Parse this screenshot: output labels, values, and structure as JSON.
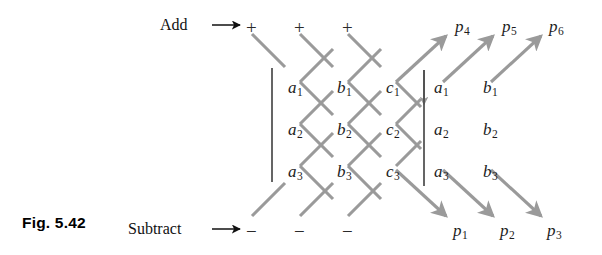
{
  "figure": {
    "caption": "Fig. 5.42",
    "add_label": "Add",
    "subtract_label": "Subtract",
    "add_arrow_icon": "right-arrow-icon",
    "subtract_arrow_icon": "right-arrow-icon",
    "line_color": "#9a9a9a",
    "text_color": "#1a1a1a",
    "background": "#ffffff"
  },
  "top_operators": [
    {
      "symbol": "+",
      "x": 246,
      "y": 18
    },
    {
      "symbol": "+",
      "x": 294,
      "y": 18
    },
    {
      "symbol": "+",
      "x": 342,
      "y": 18
    }
  ],
  "bottom_operators": [
    {
      "symbol": "−",
      "x": 246,
      "y": 222
    },
    {
      "symbol": "−",
      "x": 294,
      "y": 222
    },
    {
      "symbol": "−",
      "x": 342,
      "y": 222
    }
  ],
  "top_outputs": [
    {
      "base": "p",
      "sub": "4",
      "x": 455,
      "y": 18
    },
    {
      "base": "p",
      "sub": "5",
      "x": 502,
      "y": 18
    },
    {
      "base": "p",
      "sub": "6",
      "x": 549,
      "y": 18
    }
  ],
  "bottom_outputs": [
    {
      "base": "p",
      "sub": "1",
      "x": 453,
      "y": 222
    },
    {
      "base": "p",
      "sub": "2",
      "x": 500,
      "y": 222
    },
    {
      "base": "p",
      "sub": "3",
      "x": 547,
      "y": 222
    }
  ],
  "left_grid": [
    {
      "base": "a",
      "sub": "1",
      "x": 288,
      "y": 79
    },
    {
      "base": "b",
      "sub": "1",
      "x": 337,
      "y": 79
    },
    {
      "base": "c",
      "sub": "1",
      "x": 386,
      "y": 79
    },
    {
      "base": "a",
      "sub": "2",
      "x": 288,
      "y": 121
    },
    {
      "base": "b",
      "sub": "2",
      "x": 337,
      "y": 121
    },
    {
      "base": "c",
      "sub": "2",
      "x": 386,
      "y": 121
    },
    {
      "base": "a",
      "sub": "3",
      "x": 288,
      "y": 163
    },
    {
      "base": "b",
      "sub": "3",
      "x": 337,
      "y": 163
    },
    {
      "base": "c",
      "sub": "3",
      "x": 386,
      "y": 163
    }
  ],
  "right_grid": [
    {
      "base": "a",
      "sub": "1",
      "x": 434,
      "y": 79
    },
    {
      "base": "b",
      "sub": "1",
      "x": 483,
      "y": 79
    },
    {
      "base": "a",
      "sub": "2",
      "x": 434,
      "y": 121
    },
    {
      "base": "b",
      "sub": "2",
      "x": 483,
      "y": 121
    },
    {
      "base": "a",
      "sub": "3",
      "x": 434,
      "y": 163
    },
    {
      "base": "b",
      "sub": "3",
      "x": 483,
      "y": 163
    }
  ],
  "vertical_bars": [
    {
      "name": "left-vertical-bar",
      "x": 272,
      "y1": 68,
      "y2": 182
    },
    {
      "name": "right-vertical-bar",
      "x": 424,
      "y1": 70,
      "y2": 186
    }
  ]
}
